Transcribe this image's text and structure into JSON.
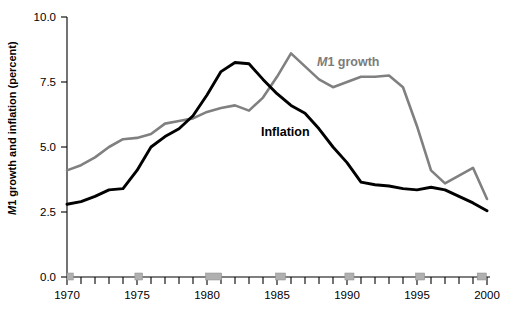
{
  "chart_data": {
    "type": "line",
    "title": "",
    "xlabel": "",
    "ylabel": "M1 growth and inflation (percent)",
    "ylabel_italic_prefix": "M",
    "ylabel_rest": "1 growth and inflation (percent)",
    "xlim": [
      1970,
      2000
    ],
    "ylim": [
      0.0,
      10.0
    ],
    "grid": false,
    "legend_position": "inline-annotations",
    "ytick_labels": [
      "0.0",
      "2.5",
      "5.0",
      "7.5",
      "10.0"
    ],
    "ytick_values": [
      0.0,
      2.5,
      5.0,
      7.5,
      10.0
    ],
    "xtick_labels": [
      "1970",
      "1975",
      "1980",
      "1985",
      "1990",
      "1995",
      "2000"
    ],
    "xtick_values": [
      1970,
      1975,
      1980,
      1985,
      1990,
      1995,
      2000
    ],
    "x": [
      1970,
      1971,
      1972,
      1973,
      1974,
      1975,
      1976,
      1977,
      1978,
      1979,
      1980,
      1981,
      1982,
      1983,
      1984,
      1985,
      1986,
      1987,
      1988,
      1989,
      1990,
      1991,
      1992,
      1993,
      1994,
      1995,
      1996,
      1997,
      1998,
      1999,
      2000
    ],
    "series": [
      {
        "name": "M1 growth",
        "color": "#808080",
        "label": "M1 growth",
        "label_italic_prefix": "M",
        "label_rest": "1 growth",
        "values": [
          4.1,
          4.3,
          4.6,
          5.0,
          5.3,
          5.35,
          5.5,
          5.9,
          6.0,
          6.1,
          6.35,
          6.5,
          6.6,
          6.4,
          6.9,
          7.7,
          8.6,
          8.1,
          7.6,
          7.3,
          7.5,
          7.7,
          7.7,
          7.75,
          7.3,
          5.8,
          4.1,
          3.6,
          3.9,
          4.2,
          3.0
        ]
      },
      {
        "name": "Inflation",
        "color": "#000000",
        "label": "Inflation",
        "values": [
          2.8,
          2.9,
          3.1,
          3.35,
          3.4,
          4.1,
          5.0,
          5.4,
          5.7,
          6.2,
          7.0,
          7.9,
          8.25,
          8.2,
          7.6,
          7.05,
          6.6,
          6.3,
          5.7,
          5.0,
          4.4,
          3.65,
          3.55,
          3.5,
          3.4,
          3.35,
          3.45,
          3.35,
          3.1,
          2.85,
          2.55
        ]
      }
    ],
    "recession_bands": [
      {
        "start": 1970.0,
        "end": 1970.45
      },
      {
        "start": 1974.85,
        "end": 1975.4
      },
      {
        "start": 1979.9,
        "end": 1981.05
      },
      {
        "start": 1984.9,
        "end": 1985.6
      },
      {
        "start": 1989.85,
        "end": 1990.5
      },
      {
        "start": 1994.9,
        "end": 1995.55
      },
      {
        "start": 1999.3,
        "end": 1999.95
      }
    ]
  }
}
